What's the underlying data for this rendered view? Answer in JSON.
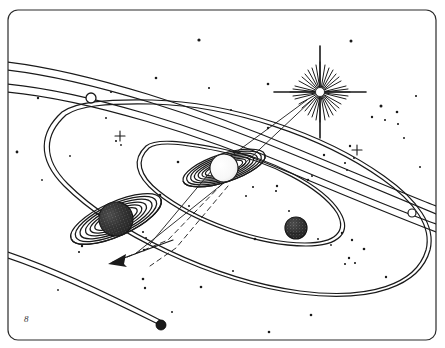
{
  "illustration": {
    "title": "Planetary System Diagram",
    "description": "Line-art drawing of a ringed central star-planet system with orbital ellipses, two ringed planets, a dark moon, a bright multi-rayed star, a comet track and a scattered starfield.",
    "medium": "pen-and-ink line drawing",
    "ink_color": "#1a1a1a",
    "background_color": "#ffffff",
    "canvas": {
      "width": 445,
      "height": 348
    }
  },
  "frame": {
    "name": "border-frame",
    "shape": "rounded-rectangle",
    "x": 8,
    "y": 10,
    "width": 428,
    "height": 330,
    "corner_radius": 10,
    "stroke_width": 1.2
  },
  "bodies": [
    {
      "id": "central-ringed-planet",
      "label": "Central ringed planet",
      "cx": 224,
      "cy": 168,
      "radius": 14,
      "fill": "light",
      "rings": 7,
      "ring_span": 44,
      "ring_tilt_deg": -18
    },
    {
      "id": "left-ringed-planet",
      "label": "Left stippled ringed planet",
      "cx": 116,
      "cy": 219,
      "radius": 17,
      "fill": "stippled-dark",
      "rings": 6,
      "ring_span": 50,
      "ring_tilt_deg": -22
    },
    {
      "id": "dark-moon",
      "label": "Dark stippled moon on inner orbit",
      "cx": 296,
      "cy": 228,
      "radius": 11,
      "fill": "stippled-dark"
    },
    {
      "id": "outer-marker-upper-left",
      "label": "Hollow marker body, upper-left orbit band",
      "cx": 91,
      "cy": 98,
      "radius": 5,
      "fill": "hollow"
    },
    {
      "id": "outer-marker-right",
      "label": "Hollow marker body, right orbit band",
      "cx": 412,
      "cy": 213,
      "radius": 4,
      "fill": "hollow"
    },
    {
      "id": "comet-head",
      "label": "Comet head at end of long track",
      "cx": 161,
      "cy": 325,
      "radius": 5,
      "fill": "solid-dark"
    }
  ],
  "star": {
    "id": "bright-star",
    "label": "Bright multi-rayed star",
    "cx": 320,
    "cy": 92,
    "core_radius": 4,
    "long_rays": 4,
    "short_rays": 20,
    "long_ray_length": 42,
    "short_ray_length": 20
  },
  "orbits": [
    {
      "id": "orbit-outer-band",
      "label": "Outermost orbit band (double line, upper)"
    },
    {
      "id": "orbit-second-band",
      "label": "Second orbit band (double line)"
    },
    {
      "id": "orbit-large-ellipse",
      "label": "Large tilted orbital ellipse"
    },
    {
      "id": "orbit-inner-ellipse",
      "label": "Inner tilted orbital ellipse"
    },
    {
      "id": "orbit-comet-track",
      "label": "Long comet / minor-body track (lower left)"
    }
  ],
  "sight_lines": {
    "solid": {
      "label": "Solid sight lines from star through central planet",
      "count": 2
    },
    "dashed": {
      "label": "Dashed projection lines toward lower-left arrow",
      "count": 2
    },
    "arrow": {
      "label": "Direction arrow pointing lower-left",
      "tip_x": 111,
      "tip_y": 262,
      "tail_x": 172,
      "tail_y": 240
    }
  },
  "markers": [
    {
      "id": "plus-star-left",
      "label": "Small plus-shaped star",
      "x": 120,
      "y": 136
    },
    {
      "id": "plus-star-right",
      "label": "Small plus-shaped star",
      "x": 357,
      "y": 150
    },
    {
      "id": "signature-mark",
      "label": "Artist mark",
      "text": "8",
      "x": 24,
      "y": 320
    }
  ],
  "starfield": {
    "label": "Scattered background stars",
    "count": 62,
    "dots": [
      [
        199,
        40,
        1.6
      ],
      [
        351,
        41,
        1.5
      ],
      [
        156,
        78,
        1.3
      ],
      [
        209,
        88,
        1.1
      ],
      [
        38,
        98,
        1.2
      ],
      [
        111,
        92,
        1.1
      ],
      [
        268,
        84,
        1.3
      ],
      [
        381,
        106,
        1.5
      ],
      [
        397,
        112,
        1.3
      ],
      [
        372,
        117,
        1.2
      ],
      [
        385,
        120,
        1.1
      ],
      [
        268,
        128,
        1.2
      ],
      [
        17,
        152,
        1.4
      ],
      [
        116,
        141,
        1.1
      ],
      [
        350,
        146,
        1.2
      ],
      [
        324,
        155,
        1.2
      ],
      [
        345,
        163,
        1.1
      ],
      [
        347,
        170,
        1.0
      ],
      [
        178,
        162,
        1.3
      ],
      [
        70,
        156,
        0.9
      ],
      [
        160,
        195,
        1.3
      ],
      [
        277,
        186,
        1.2
      ],
      [
        276,
        191,
        1.1
      ],
      [
        308,
        180,
        1.2
      ],
      [
        253,
        187,
        1.1
      ],
      [
        312,
        176,
        1.0
      ],
      [
        82,
        246,
        1.2
      ],
      [
        79,
        252,
        1.1
      ],
      [
        143,
        232,
        1.1
      ],
      [
        146,
        238,
        1.0
      ],
      [
        144,
        250,
        1.2
      ],
      [
        143,
        279,
        1.3
      ],
      [
        145,
        288,
        1.2
      ],
      [
        255,
        239,
        1.3
      ],
      [
        342,
        233,
        1.2
      ],
      [
        352,
        240,
        1.2
      ],
      [
        364,
        249,
        1.3
      ],
      [
        349,
        258,
        1.2
      ],
      [
        345,
        264,
        1.1
      ],
      [
        355,
        263,
        1.1
      ],
      [
        386,
        277,
        1.2
      ],
      [
        201,
        287,
        1.3
      ],
      [
        311,
        315,
        1.3
      ],
      [
        269,
        332,
        1.3
      ],
      [
        398,
        124,
        1.1
      ],
      [
        354,
        158,
        1.0
      ],
      [
        121,
        145,
        0.9
      ],
      [
        223,
        172,
        0.9
      ],
      [
        246,
        196,
        1.0
      ],
      [
        289,
        211,
        1.0
      ],
      [
        318,
        239,
        1.0
      ],
      [
        331,
        245,
        0.9
      ],
      [
        189,
        206,
        1.0
      ],
      [
        106,
        118,
        1.0
      ],
      [
        231,
        110,
        1.0
      ],
      [
        42,
        180,
        0.9
      ],
      [
        58,
        290,
        0.9
      ],
      [
        416,
        96,
        1.1
      ],
      [
        404,
        138,
        1.0
      ],
      [
        420,
        167,
        1.0
      ],
      [
        172,
        312,
        1.0
      ],
      [
        233,
        271,
        1.0
      ]
    ]
  }
}
